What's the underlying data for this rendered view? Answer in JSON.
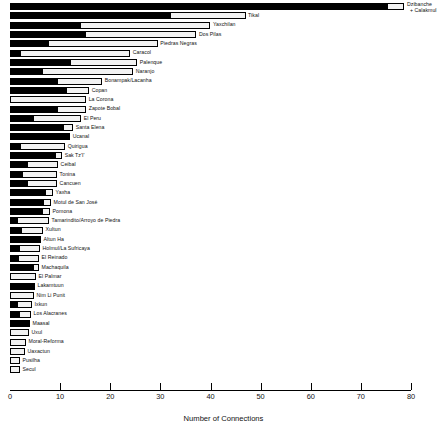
{
  "chart_data": {
    "type": "bar",
    "orientation": "horizontal",
    "stacked": true,
    "title": "",
    "xlabel": "Number of Connections",
    "ylabel": "",
    "xlim": [
      0,
      80
    ],
    "xticks": [
      0,
      10,
      20,
      30,
      40,
      50,
      60,
      70,
      80
    ],
    "grid": false,
    "legend": null,
    "series": [
      {
        "name": "black-segment",
        "color": "#000000"
      },
      {
        "name": "white-segment",
        "color": "#f2f2f2"
      }
    ],
    "categories": [
      "Dzibanche\n+ Calakmul",
      "Tikal",
      "Yaxchilan",
      "Dos Pilas",
      "Piedras Negras",
      "Caracol",
      "Palenque",
      "Naranjo",
      "Bonampak/Lacanha",
      "Copan",
      "La Corona",
      "Zapote Bobal",
      "El Peru",
      "Santa Elena",
      "Ucanal",
      "Quirigua",
      "Sak Tz'I'",
      "Ceibal",
      "Tonina",
      "Cancuen",
      "Yaxha",
      "Motul de San José",
      "Pomona",
      "Tamarindito/Arroyo de Piedra",
      "Xultun",
      "Altun Ha",
      "Holmul/La Sufricaya",
      "El Reinado",
      "Machaquila",
      "El Palmar",
      "Lakamtuun",
      "Nim Li Punit",
      "Ixkun",
      "Los Alacranes",
      "Maasal",
      "Uxul",
      "Moral-Reforma",
      "Uaxactun",
      "Pusilha",
      "Secul"
    ],
    "rows": [
      {
        "label": "Dzibanche",
        "label2": "+ Calakmul",
        "black": 75.2,
        "white": 3.5,
        "total": 78.7
      },
      {
        "label": "Tikal",
        "black": 32.0,
        "white": 15.0,
        "total": 47.0
      },
      {
        "label": "Yaxchilan",
        "black": 14.0,
        "white": 26.0,
        "total": 40.0
      },
      {
        "label": "Dos Pilas",
        "black": 15.0,
        "white": 22.2,
        "total": 37.2
      },
      {
        "label": "Piedras Negras",
        "black": 7.5,
        "white": 22.0,
        "total": 29.5
      },
      {
        "label": "Caracol",
        "black": 2.0,
        "white": 22.0,
        "total": 24.0
      },
      {
        "label": "Palenque",
        "black": 12.0,
        "white": 13.4,
        "total": 25.4
      },
      {
        "label": "Naranjo",
        "black": 6.4,
        "white": 18.2,
        "total": 24.6
      },
      {
        "label": "Bonampak/Lacanha",
        "black": 9.4,
        "white": 9.0,
        "total": 18.4
      },
      {
        "label": "Copan",
        "black": 11.2,
        "white": 4.6,
        "total": 15.8
      },
      {
        "label": "La Corona",
        "black": 0.0,
        "white": 15.2,
        "total": 15.2
      },
      {
        "label": "Zapote Bobal",
        "black": 9.4,
        "white": 5.8,
        "total": 15.2
      },
      {
        "label": "El Peru",
        "black": 4.6,
        "white": 9.6,
        "total": 14.2
      },
      {
        "label": "Santa Elena",
        "black": 10.6,
        "white": 2.0,
        "total": 12.6
      },
      {
        "label": "Ucanal",
        "black": 12.0,
        "white": 0.0,
        "total": 12.0
      },
      {
        "label": "Quirigua",
        "black": 2.0,
        "white": 9.0,
        "total": 11.0
      },
      {
        "label": "Sak Tz'I'",
        "black": 9.0,
        "white": 1.4,
        "total": 10.4
      },
      {
        "label": "Ceibal",
        "black": 3.4,
        "white": 6.2,
        "total": 9.6
      },
      {
        "label": "Tonina",
        "black": 2.4,
        "white": 7.0,
        "total": 9.4
      },
      {
        "label": "Cancuen",
        "black": 3.4,
        "white": 6.0,
        "total": 9.4
      },
      {
        "label": "Yaxha",
        "black": 7.0,
        "white": 1.6,
        "total": 8.6
      },
      {
        "label": "Motul de San José",
        "black": 6.6,
        "white": 1.6,
        "total": 8.2
      },
      {
        "label": "Pomona",
        "black": 6.4,
        "white": 1.6,
        "total": 8.0
      },
      {
        "label": "Tamarindito/Arroyo de Piedra",
        "black": 1.4,
        "white": 6.4,
        "total": 7.8
      },
      {
        "label": "Xultun",
        "black": 2.2,
        "white": 4.4,
        "total": 6.6
      },
      {
        "label": "Altun Ha",
        "black": 6.2,
        "white": 0.0,
        "total": 6.2
      },
      {
        "label": "Holmul/La Sufricaya",
        "black": 1.8,
        "white": 4.2,
        "total": 6.0
      },
      {
        "label": "El Reinado",
        "black": 1.6,
        "white": 4.2,
        "total": 5.8
      },
      {
        "label": "Machaquila",
        "black": 4.6,
        "white": 1.2,
        "total": 5.8
      },
      {
        "label": "El Palmar",
        "black": 0.0,
        "white": 5.2,
        "total": 5.2
      },
      {
        "label": "Lakamtuun",
        "black": 5.0,
        "white": 0.0,
        "total": 5.0
      },
      {
        "label": "Nim Li Punit",
        "black": 0.0,
        "white": 4.8,
        "total": 4.8
      },
      {
        "label": "Ixkun",
        "black": 1.4,
        "white": 3.0,
        "total": 4.4
      },
      {
        "label": "Los Alacranes",
        "black": 1.8,
        "white": 2.4,
        "total": 4.2
      },
      {
        "label": "Maasal",
        "black": 4.0,
        "white": 0.0,
        "total": 4.0
      },
      {
        "label": "Uxul",
        "black": 0.0,
        "white": 3.8,
        "total": 3.8
      },
      {
        "label": "Moral-Reforma",
        "black": 0.0,
        "white": 3.2,
        "total": 3.2
      },
      {
        "label": "Uaxactun",
        "black": 0.0,
        "white": 3.0,
        "total": 3.0
      },
      {
        "label": "Pusilha",
        "black": 0.0,
        "white": 2.0,
        "total": 2.0
      },
      {
        "label": "Secul",
        "black": 0.0,
        "white": 2.0,
        "total": 2.0
      }
    ]
  }
}
